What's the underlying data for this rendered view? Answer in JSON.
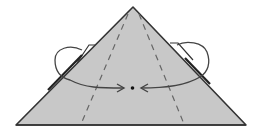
{
  "diagram": {
    "type": "origami-fold-step",
    "shape": "triangle",
    "colors": {
      "paper_fill": "#c8c8c8",
      "outline": "#333333",
      "dashed": "#666666",
      "arrow": "#444444",
      "background": "#ffffff"
    },
    "elements": {
      "triangle": "paper-triangle",
      "valley_folds": [
        "left-valley-fold-line",
        "right-valley-fold-line"
      ],
      "arrows": [
        "left-fold-arrow",
        "right-fold-arrow"
      ],
      "target_point": "center-dot"
    }
  }
}
